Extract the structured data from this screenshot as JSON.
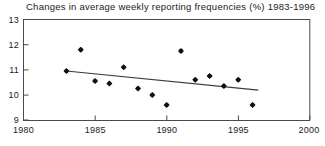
{
  "chart_data": {
    "type": "scatter",
    "title": "Changes in average weekly reporting frequencies (%) 1983-1996",
    "xlabel": "",
    "ylabel": "",
    "xlim": [
      1980,
      2000
    ],
    "ylim": [
      9,
      13
    ],
    "xticks": [
      1980,
      1985,
      1990,
      1995,
      2000
    ],
    "yticks": [
      9,
      10,
      11,
      12,
      13
    ],
    "grid": false,
    "legend": "none",
    "x": [
      1983,
      1984,
      1985,
      1986,
      1987,
      1988,
      1989,
      1990,
      1991,
      1992,
      1993,
      1994,
      1995,
      1996
    ],
    "values": [
      10.95,
      11.8,
      10.55,
      10.45,
      11.1,
      10.25,
      10.0,
      9.6,
      11.75,
      10.6,
      10.75,
      10.35,
      10.6,
      9.6
    ],
    "series": [
      {
        "name": "Average weekly reporting frequency",
        "marker": "diamond",
        "color": "#111111",
        "x": [
          1983,
          1984,
          1985,
          1986,
          1987,
          1988,
          1989,
          1990,
          1991,
          1992,
          1993,
          1994,
          1995,
          1996
        ],
        "values": [
          10.95,
          11.8,
          10.55,
          10.45,
          11.1,
          10.25,
          10.0,
          9.6,
          11.75,
          10.6,
          10.75,
          10.35,
          10.6,
          9.6
        ]
      },
      {
        "name": "Linear trend",
        "type": "line",
        "color": "#3a3a3a",
        "x": [
          1983,
          1996.4
        ],
        "values": [
          10.95,
          10.19
        ]
      }
    ],
    "annotations": []
  },
  "axes": {
    "x_tick_labels": [
      "1980",
      "1985",
      "1990",
      "1995",
      "2000"
    ],
    "y_tick_labels": [
      "9",
      "10",
      "11",
      "12",
      "13"
    ]
  }
}
